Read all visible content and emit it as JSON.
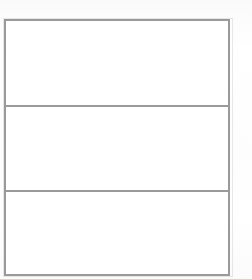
{
  "document": {
    "kind": "scanned-form-fragment",
    "description": "Blank three-row bordered table on white page",
    "page_background": "#ffffff",
    "border_color": "#9a9a9a",
    "border_width_px": 2
  },
  "table": {
    "columns": 1,
    "rows": 3,
    "column_headers": [
      ""
    ],
    "rows_data": [
      {
        "row_index": 1,
        "cells": [
          ""
        ]
      },
      {
        "row_index": 2,
        "cells": [
          ""
        ]
      },
      {
        "row_index": 3,
        "cells": [
          ""
        ]
      }
    ]
  }
}
